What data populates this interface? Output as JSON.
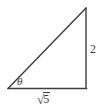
{
  "figure": {
    "type": "right-triangle-diagram",
    "background_color": "#ffffff",
    "stroke_color": "#3d3d3d",
    "text_color": "#3d3d3d",
    "angle_label": "θ",
    "side_right_label": "2",
    "side_bottom_radical_sign": "√",
    "side_bottom_radicand": "5",
    "side_bottom_label": "√5",
    "vertices": {
      "bottom_left": [
        8,
        88
      ],
      "bottom_right": [
        86,
        88
      ],
      "apex": [
        86,
        8
      ]
    }
  }
}
